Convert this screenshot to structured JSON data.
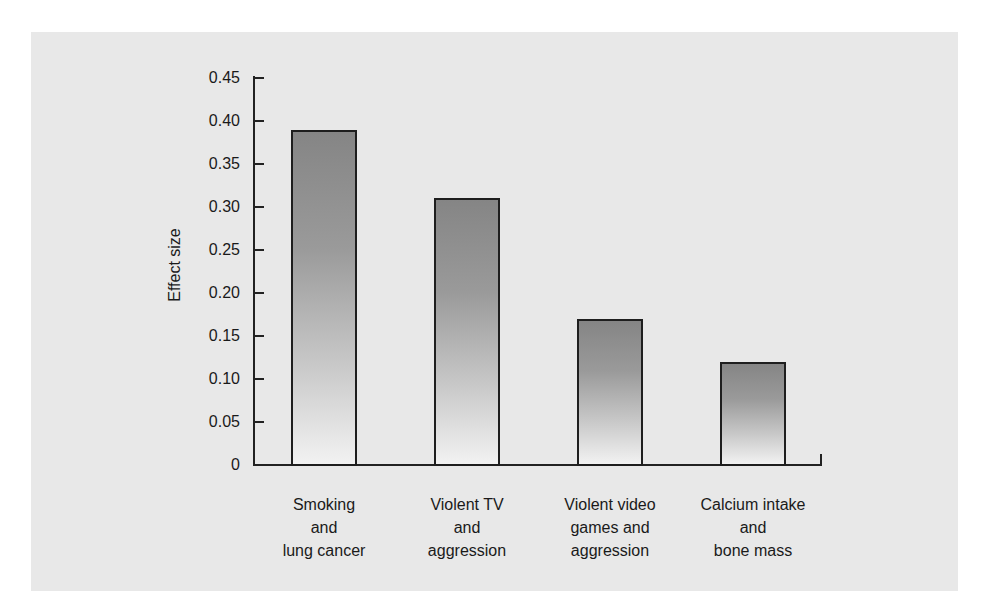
{
  "chart_data": {
    "type": "bar",
    "title": "",
    "xlabel": "",
    "ylabel": "Effect size",
    "ylim": [
      0,
      0.45
    ],
    "yticks": [
      "0",
      "0.05",
      "0.10",
      "0.15",
      "0.20",
      "0.25",
      "0.30",
      "0.35",
      "0.40",
      "0.45"
    ],
    "categories": [
      "Smoking and lung cancer",
      "Violent TV and aggression",
      "Violent video games and aggression",
      "Calcium intake and bone mass"
    ],
    "category_lines": [
      "Smoking\nand\nlung cancer",
      "Violent TV\nand\naggression",
      "Violent video\ngames and\naggression",
      "Calcium intake\nand\nbone mass"
    ],
    "values": [
      0.39,
      0.31,
      0.17,
      0.12
    ],
    "grid": false,
    "legend": null,
    "bar_fill": "vertical gradient dark gray (top) to near-white (bottom)",
    "bar_border_color": "#1e1e1e",
    "background_color": "#e8e8e8"
  }
}
